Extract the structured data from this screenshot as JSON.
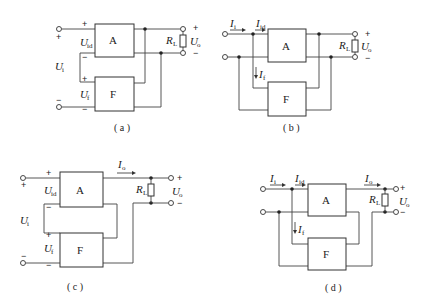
{
  "figures": [
    {
      "id": "a",
      "caption": "( a )",
      "block_top": "A",
      "block_bottom": "F",
      "labels": {
        "ui": "U",
        "ui_sub": "i",
        "uid": "U",
        "uid_sub": "id",
        "uf": "U",
        "uf_sub": "f",
        "rl": "R",
        "rl_sub": "L",
        "uo": "U",
        "uo_sub": "o"
      },
      "signs": {
        "plus": "+",
        "minus": "−"
      }
    },
    {
      "id": "b",
      "caption": "( b )",
      "block_top": "A",
      "block_bottom": "F",
      "labels": {
        "ii": "I",
        "ii_sub": "i",
        "iid": "I",
        "iid_sub": "id",
        "if": "I",
        "if_sub": "f",
        "rl": "R",
        "rl_sub": "L",
        "uo": "U",
        "uo_sub": "o"
      },
      "signs": {
        "plus": "+",
        "minus": "−"
      }
    },
    {
      "id": "c",
      "caption": "( c )",
      "block_top": "A",
      "block_bottom": "F",
      "labels": {
        "ui": "U",
        "ui_sub": "i",
        "uid": "U",
        "uid_sub": "id",
        "uf": "U",
        "uf_sub": "f",
        "io": "I",
        "io_sub": "o",
        "rl": "R",
        "rl_sub": "L",
        "uo": "U",
        "uo_sub": "o"
      },
      "signs": {
        "plus": "+",
        "minus": "−"
      }
    },
    {
      "id": "d",
      "caption": "( d )",
      "block_top": "A",
      "block_bottom": "F",
      "labels": {
        "ii": "I",
        "ii_sub": "i",
        "iid": "I",
        "iid_sub": "id",
        "if": "I",
        "if_sub": "f",
        "io": "I",
        "io_sub": "o",
        "rl": "R",
        "rl_sub": "L",
        "uo": "U",
        "uo_sub": "o"
      },
      "signs": {
        "plus": "+",
        "minus": "−"
      }
    }
  ]
}
